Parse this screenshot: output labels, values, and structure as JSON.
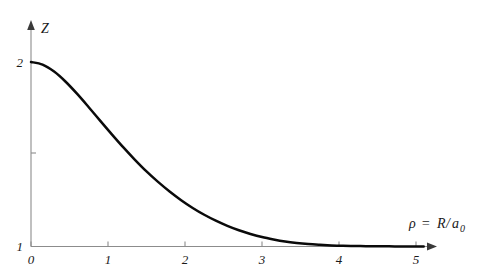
{
  "chart_data": {
    "type": "line",
    "title": "",
    "subtitle": "",
    "xlabel": "ρ = R/a₀",
    "xlabel_parts": {
      "symbol": "ρ",
      "equals": "=",
      "numerator": "R",
      "slash": "/",
      "denominator": "a",
      "subscript": "0"
    },
    "ylabel": "Z",
    "xlim": [
      0,
      5.25
    ],
    "ylim": [
      1,
      2.1
    ],
    "grid": false,
    "legend": null,
    "legend_position": "none",
    "x_ticks": [
      0,
      1,
      2,
      3,
      4,
      5
    ],
    "x_tick_labels": [
      "0",
      "1",
      "2",
      "3",
      "4",
      "5"
    ],
    "y_ticks": [
      1,
      1.5,
      2
    ],
    "y_tick_labels": [
      "1",
      "",
      "2"
    ],
    "series": [
      {
        "name": "effective-nuclear-charge",
        "color": "#0a0a0a",
        "x": [
          0.0,
          0.15,
          0.3,
          0.45,
          0.6,
          0.75,
          0.9,
          1.05,
          1.2,
          1.35,
          1.5,
          1.65,
          1.8,
          1.95,
          2.1,
          2.25,
          2.4,
          2.55,
          2.7,
          2.85,
          3.0,
          3.15,
          3.3,
          3.45,
          3.6,
          3.75,
          3.9,
          4.05,
          4.2,
          4.35,
          4.5,
          4.65,
          4.8,
          4.95,
          5.1
        ],
        "y": [
          2.0,
          1.986,
          1.948,
          1.893,
          1.827,
          1.755,
          1.681,
          1.608,
          1.537,
          1.47,
          1.407,
          1.35,
          1.298,
          1.251,
          1.209,
          1.172,
          1.14,
          1.112,
          1.088,
          1.068,
          1.051,
          1.038,
          1.027,
          1.019,
          1.013,
          1.009,
          1.006,
          1.004,
          1.003,
          1.002,
          1.001,
          1.001,
          1.0,
          1.0,
          1.0
        ]
      }
    ],
    "annotations": []
  },
  "figure": {
    "background_color": "#ffffff",
    "axis_color": "#8c8c8c",
    "curve_color": "#0a0a0a",
    "text_color": "#1a1a1a"
  }
}
